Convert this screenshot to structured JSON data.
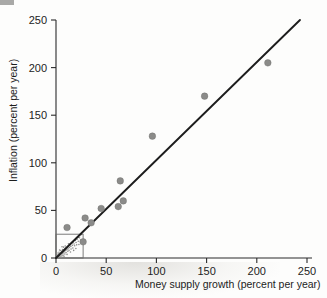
{
  "chart_data": {
    "type": "scatter",
    "title": "",
    "xlabel": "Money supply growth (percent per year)",
    "ylabel": "Inflation (percent per year)",
    "xlim": [
      0,
      255
    ],
    "ylim": [
      0,
      258
    ],
    "xticks": [
      "0",
      "50",
      "100",
      "150",
      "200",
      "250"
    ],
    "xtick_values": [
      0,
      50,
      100,
      150,
      200,
      250
    ],
    "yticks": [
      "0",
      "50",
      "100",
      "150",
      "200",
      "250"
    ],
    "ytick_values": [
      0,
      50,
      100,
      150,
      200,
      250
    ],
    "grid": false,
    "legend": "none",
    "series": [
      {
        "name": "Countries",
        "marker": "filled-circle",
        "color": "#8b8b89",
        "points": [
          {
            "x": 11,
            "y": 32
          },
          {
            "x": 27,
            "y": 17
          },
          {
            "x": 29,
            "y": 42
          },
          {
            "x": 35,
            "y": 37
          },
          {
            "x": 45,
            "y": 52
          },
          {
            "x": 62,
            "y": 54
          },
          {
            "x": 64,
            "y": 81
          },
          {
            "x": 67,
            "y": 60
          },
          {
            "x": 96,
            "y": 128
          },
          {
            "x": 148,
            "y": 170
          },
          {
            "x": 211,
            "y": 205
          }
        ]
      }
    ],
    "fit_line": {
      "name": "Regression line",
      "color": "#1d1d1d",
      "x_start": 0,
      "y_start": 0,
      "x_end": 243,
      "y_end": 250
    },
    "inset": {
      "name": "origin-detail-box",
      "x_range": [
        0,
        27
      ],
      "y_range": [
        0,
        25
      ],
      "description": "dense cluster of low-inflation countries",
      "cluster_points": [
        {
          "x": 1.2,
          "y": 1.0
        },
        {
          "x": 2.0,
          "y": 2.4
        },
        {
          "x": 2.6,
          "y": 1.6
        },
        {
          "x": 3.4,
          "y": 3.6
        },
        {
          "x": 3.9,
          "y": 2.6
        },
        {
          "x": 4.5,
          "y": 5.0
        },
        {
          "x": 5.1,
          "y": 3.4
        },
        {
          "x": 5.6,
          "y": 6.2
        },
        {
          "x": 6.2,
          "y": 4.6
        },
        {
          "x": 6.9,
          "y": 7.4
        },
        {
          "x": 7.3,
          "y": 5.4
        },
        {
          "x": 7.9,
          "y": 8.6
        },
        {
          "x": 8.4,
          "y": 6.6
        },
        {
          "x": 9.0,
          "y": 9.6
        },
        {
          "x": 9.6,
          "y": 7.8
        },
        {
          "x": 10.2,
          "y": 10.8
        },
        {
          "x": 10.8,
          "y": 8.8
        },
        {
          "x": 11.4,
          "y": 12.0
        },
        {
          "x": 12.0,
          "y": 9.8
        },
        {
          "x": 12.7,
          "y": 13.2
        },
        {
          "x": 13.3,
          "y": 11.0
        },
        {
          "x": 14.0,
          "y": 14.4
        },
        {
          "x": 14.8,
          "y": 12.2
        },
        {
          "x": 15.6,
          "y": 15.6
        },
        {
          "x": 16.4,
          "y": 13.4
        },
        {
          "x": 17.2,
          "y": 17.0
        },
        {
          "x": 18.0,
          "y": 14.8
        },
        {
          "x": 19.0,
          "y": 18.4
        },
        {
          "x": 20.0,
          "y": 16.2
        },
        {
          "x": 21.0,
          "y": 19.8
        },
        {
          "x": 22.2,
          "y": 17.6
        },
        {
          "x": 23.4,
          "y": 21.2
        },
        {
          "x": 24.6,
          "y": 19.0
        },
        {
          "x": 2.8,
          "y": 4.4
        },
        {
          "x": 4.0,
          "y": 1.2
        },
        {
          "x": 5.9,
          "y": 2.2
        },
        {
          "x": 7.0,
          "y": 3.0
        },
        {
          "x": 8.8,
          "y": 4.2
        },
        {
          "x": 10.0,
          "y": 5.8
        },
        {
          "x": 11.8,
          "y": 7.0
        },
        {
          "x": 13.0,
          "y": 8.2
        },
        {
          "x": 15.0,
          "y": 9.4
        },
        {
          "x": 16.8,
          "y": 10.6
        },
        {
          "x": 18.6,
          "y": 12.8
        },
        {
          "x": 20.6,
          "y": 13.8
        },
        {
          "x": 1.6,
          "y": 3.2
        },
        {
          "x": 3.0,
          "y": 6.0
        },
        {
          "x": 6.6,
          "y": 9.0
        },
        {
          "x": 9.2,
          "y": 12.6
        },
        {
          "x": 12.4,
          "y": 15.0
        },
        {
          "x": 2.2,
          "y": 0.6
        },
        {
          "x": 4.8,
          "y": 7.8
        },
        {
          "x": 7.6,
          "y": 11.4
        },
        {
          "x": 5.0,
          "y": 0.8
        },
        {
          "x": 8.0,
          "y": 1.8
        },
        {
          "x": 11.0,
          "y": 3.8
        },
        {
          "x": 14.4,
          "y": 6.4
        },
        {
          "x": 17.6,
          "y": 8.0
        },
        {
          "x": 3.6,
          "y": 8.4
        },
        {
          "x": 6.0,
          "y": 11.8
        },
        {
          "x": 1.0,
          "y": 5.2
        },
        {
          "x": 19.8,
          "y": 10.0
        },
        {
          "x": 22.8,
          "y": 14.2
        }
      ]
    }
  },
  "axes": {
    "x_title": "Money supply growth (percent per year)",
    "y_title": "Inflation (percent per year)"
  }
}
